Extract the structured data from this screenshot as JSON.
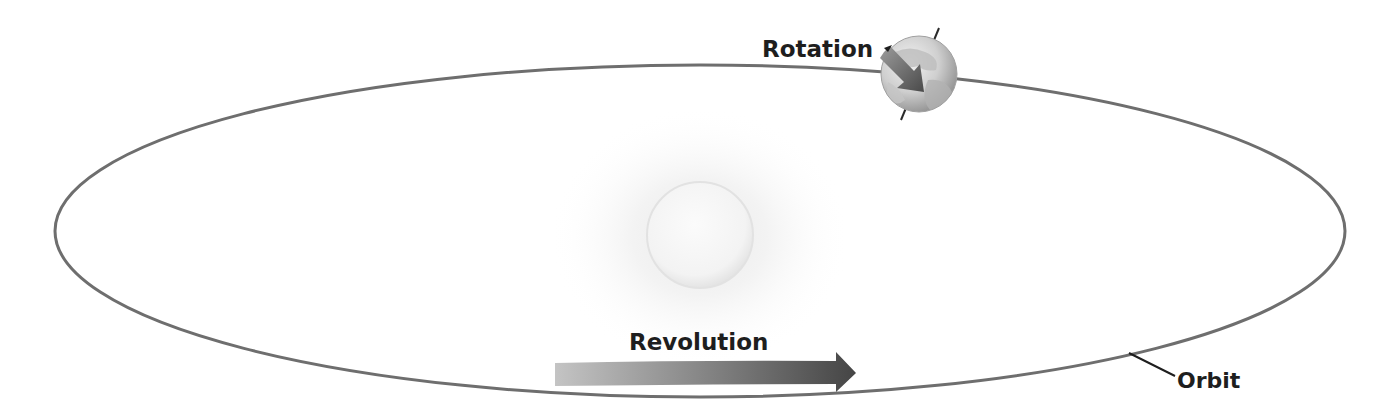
{
  "diagram": {
    "type": "earth-sun orbital motion",
    "labels": {
      "rotation": "Rotation",
      "revolution": "Revolution",
      "orbit": "Orbit"
    },
    "elements": {
      "sun": {
        "description": "Sun (pale glowing circle at center)"
      },
      "earth": {
        "description": "Earth globe on orbit with tilted axis and rotation arrow"
      },
      "orbit": {
        "description": "Elliptical orbit path"
      },
      "revolution_arrow": {
        "description": "Gradient arrow indicating direction of revolution"
      }
    },
    "colors": {
      "orbit_stroke": "#6e6e6e",
      "text": "#1e1e1e",
      "arrow_light": "#c4c4c4",
      "arrow_dark": "#454545",
      "earth_light": "#ececec",
      "earth_dark": "#9a9a9a"
    }
  }
}
